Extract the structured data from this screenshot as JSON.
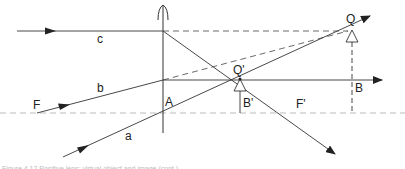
{
  "diagram": {
    "type": "converging-lens-ray-diagram",
    "colors": {
      "line": "#333333",
      "axis": "#999999",
      "background": "#ffffff"
    },
    "labels": {
      "ray_a": "a",
      "ray_b": "b",
      "ray_c": "c",
      "focus_front": "F",
      "focus_back": "F'",
      "lens_axis_point": "A",
      "object_top": "Q",
      "object_base": "B",
      "image_top": "Q'",
      "image_base": "B'"
    },
    "caption": "Figure 4.12 Positive lens: virtual object and image (cont.)"
  }
}
